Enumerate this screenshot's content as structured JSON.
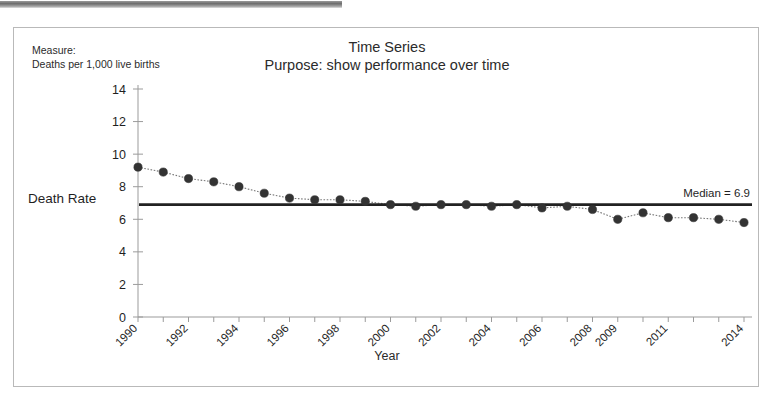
{
  "chart_data": {
    "type": "line",
    "title": "Time Series",
    "subtitle": "Purpose: show performance over time",
    "xlabel": "Year",
    "ylabel": "Death Rate",
    "measure_label": "Measure:",
    "measure_value": "Deaths per 1,000 live births",
    "ylim": [
      0,
      14
    ],
    "yticks": [
      0,
      2,
      4,
      6,
      8,
      10,
      12,
      14
    ],
    "ytick_labels": [
      "0",
      "2",
      "4",
      "6",
      "8",
      "10",
      "12",
      "14"
    ],
    "xtick_labels": [
      "1990",
      "1992",
      "1994",
      "1996",
      "1998",
      "2000",
      "2002",
      "2004",
      "2006",
      "2008",
      "2009",
      "2011",
      "2014"
    ],
    "grid": false,
    "legend": "none",
    "x": [
      1990,
      1991,
      1992,
      1993,
      1994,
      1995,
      1996,
      1997,
      1998,
      1999,
      2000,
      2001,
      2002,
      2003,
      2004,
      2005,
      2006,
      2007,
      2008,
      2009,
      2010,
      2011,
      2012,
      2013,
      2014
    ],
    "categories": [
      "1990",
      "1991",
      "1992",
      "1993",
      "1994",
      "1995",
      "1996",
      "1997",
      "1998",
      "1999",
      "2000",
      "2001",
      "2002",
      "2003",
      "2004",
      "2005",
      "2006",
      "2007",
      "2008",
      "2009",
      "2010",
      "2011",
      "2012",
      "2013",
      "2014"
    ],
    "values": [
      9.2,
      8.9,
      8.5,
      8.3,
      8.0,
      7.6,
      7.3,
      7.2,
      7.2,
      7.1,
      6.9,
      6.8,
      6.9,
      6.9,
      6.8,
      6.9,
      6.7,
      6.8,
      6.6,
      6.0,
      6.4,
      6.1,
      6.1,
      6.0,
      5.8
    ],
    "series": [
      {
        "name": "Death Rate",
        "values": [
          9.2,
          8.9,
          8.5,
          8.3,
          8.0,
          7.6,
          7.3,
          7.2,
          7.2,
          7.1,
          6.9,
          6.8,
          6.9,
          6.9,
          6.8,
          6.9,
          6.7,
          6.8,
          6.6,
          6.0,
          6.4,
          6.1,
          6.1,
          6.0,
          5.8
        ]
      }
    ],
    "reference_line": {
      "label": "Median = 6.9",
      "value": 6.9,
      "color": "#222222"
    },
    "marker_color": "#333333",
    "line_color": "#777777"
  }
}
